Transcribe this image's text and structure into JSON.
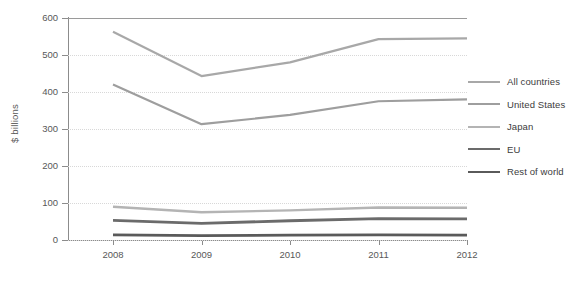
{
  "chart_data": {
    "type": "line",
    "title": "",
    "xlabel": "",
    "ylabel": "$ billions",
    "categories": [
      "2008",
      "2009",
      "2010",
      "2011",
      "2012"
    ],
    "x": [
      2008,
      2009,
      2010,
      2011,
      2012
    ],
    "ylim": [
      0,
      600
    ],
    "yticks": [
      "0",
      "100",
      "200",
      "300",
      "400",
      "500",
      "600"
    ],
    "ytick_values": [
      0,
      100,
      200,
      300,
      400,
      500,
      600
    ],
    "grid": "horizontal-dotted",
    "legend_position": "right",
    "series": [
      {
        "name": "All countries",
        "color": "#a8a8a8",
        "width": 2.2,
        "values": [
          563,
          443,
          480,
          543,
          545
        ]
      },
      {
        "name": "United States",
        "color": "#9e9e9e",
        "width": 2.2,
        "values": [
          420,
          313,
          338,
          375,
          380
        ]
      },
      {
        "name": "Japan",
        "color": "#b4b4b4",
        "width": 2.4,
        "values": [
          90,
          75,
          80,
          88,
          87
        ]
      },
      {
        "name": "EU",
        "color": "#6b6b6b",
        "width": 2.8,
        "values": [
          53,
          45,
          52,
          58,
          57
        ]
      },
      {
        "name": "Rest of world",
        "color": "#5a5a5a",
        "width": 2.8,
        "values": [
          14,
          12,
          13,
          14,
          13
        ]
      }
    ]
  },
  "axis": {
    "y_title": "$ billions"
  },
  "footnote": {
    "text": ""
  }
}
